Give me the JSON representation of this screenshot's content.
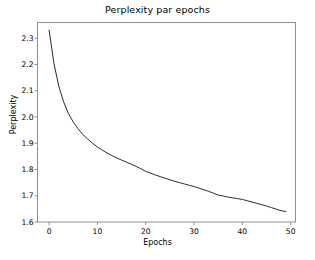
{
  "chart_data": {
    "type": "line",
    "title": "Perplexity par epochs",
    "xlabel": "Epochs",
    "ylabel": "Perplexity",
    "xlim": [
      -2.4,
      51.0
    ],
    "ylim": [
      1.6,
      2.36
    ],
    "xticks": [
      "0",
      "10",
      "20",
      "30",
      "40",
      "50"
    ],
    "xtick_values": [
      0,
      10,
      20,
      30,
      40,
      50
    ],
    "yticks": [
      "1.6",
      "1.7",
      "1.8",
      "1.9",
      "2.0",
      "2.1",
      "2.2",
      "2.3"
    ],
    "ytick_values": [
      1.6,
      1.7,
      1.8,
      1.9,
      2.0,
      2.1,
      2.2,
      2.3
    ],
    "grid": false,
    "legend": false,
    "line_color": "#2b2b2b",
    "line_width": 1.0,
    "background_color": "#ffffff",
    "axes_color": "#8f8f8f",
    "series": [
      {
        "name": "Perplexity",
        "x": [
          0,
          1,
          2,
          3,
          4,
          5,
          6,
          7,
          8,
          9,
          10,
          11,
          12,
          13,
          14,
          15,
          16,
          17,
          18,
          19,
          20,
          21,
          22,
          23,
          24,
          25,
          26,
          27,
          28,
          29,
          30,
          31,
          32,
          33,
          34,
          35,
          36,
          37,
          38,
          39,
          40,
          41,
          42,
          43,
          44,
          45,
          46,
          47,
          48,
          49
        ],
        "values": [
          2.331,
          2.204,
          2.118,
          2.058,
          2.013,
          1.981,
          1.955,
          1.933,
          1.916,
          1.9,
          1.886,
          1.874,
          1.863,
          1.853,
          1.844,
          1.836,
          1.828,
          1.82,
          1.812,
          1.803,
          1.793,
          1.786,
          1.779,
          1.773,
          1.767,
          1.761,
          1.755,
          1.75,
          1.745,
          1.74,
          1.735,
          1.729,
          1.723,
          1.717,
          1.71,
          1.703,
          1.699,
          1.695,
          1.692,
          1.689,
          1.686,
          1.681,
          1.676,
          1.671,
          1.666,
          1.661,
          1.655,
          1.649,
          1.643,
          1.64
        ]
      }
    ]
  }
}
